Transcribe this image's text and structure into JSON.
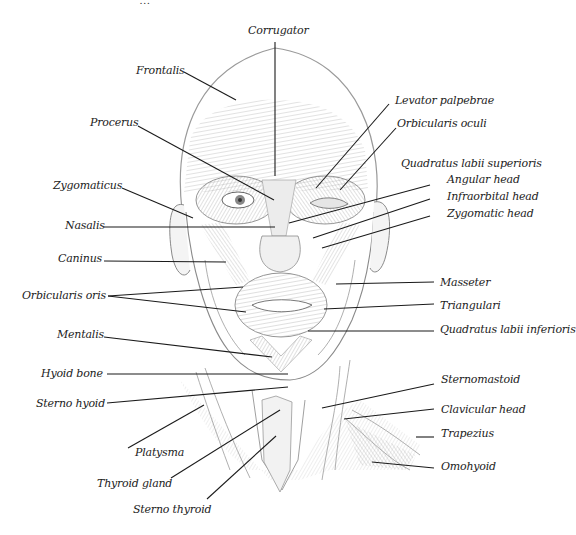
{
  "figure": {
    "title_partial": "…",
    "line_color": "#1a1a1a",
    "sketch_color": "#8a8a8a",
    "text_color": "#222222"
  },
  "labels": [
    {
      "id": "corrugator",
      "text": "Corrugator",
      "x": 248,
      "y": 24,
      "align": "left",
      "line": [
        [
          275,
          42
        ],
        [
          275,
          176
        ]
      ]
    },
    {
      "id": "frontalis",
      "text": "Frontalis",
      "x": 136,
      "y": 64,
      "align": "left",
      "line": [
        [
          184,
          72
        ],
        [
          236,
          100
        ]
      ]
    },
    {
      "id": "procerus",
      "text": "Procerus",
      "x": 90,
      "y": 116,
      "align": "left",
      "line": [
        [
          138,
          126
        ],
        [
          274,
          200
        ]
      ]
    },
    {
      "id": "levator-palpebrae",
      "text": "Levator palpebrae",
      "x": 395,
      "y": 94,
      "align": "left",
      "line": [
        [
          389,
          104
        ],
        [
          316,
          188
        ]
      ]
    },
    {
      "id": "orbicularis-oculi",
      "text": "Orbicularis oculi",
      "x": 397,
      "y": 117,
      "align": "left",
      "line": [
        [
          396,
          128
        ],
        [
          340,
          190
        ]
      ]
    },
    {
      "id": "quadratus-labii-superioris",
      "text": "Quadratus labii superioris",
      "x": 401,
      "y": 157,
      "align": "left",
      "line": null
    },
    {
      "id": "angular-head",
      "text": "Angular head",
      "x": 447,
      "y": 173,
      "align": "left",
      "line": [
        [
          430,
          185
        ],
        [
          289,
          223
        ]
      ]
    },
    {
      "id": "infraorbital-head",
      "text": "Infraorbital head",
      "x": 447,
      "y": 190,
      "align": "left",
      "line": [
        [
          430,
          199
        ],
        [
          313,
          238
        ]
      ]
    },
    {
      "id": "zygomatic-head",
      "text": "Zygomatic head",
      "x": 447,
      "y": 207,
      "align": "left",
      "line": [
        [
          430,
          216
        ],
        [
          322,
          248
        ]
      ]
    },
    {
      "id": "zygomaticus",
      "text": "Zygomaticus",
      "x": 53,
      "y": 179,
      "align": "left",
      "line": [
        [
          122,
          188
        ],
        [
          193,
          218
        ]
      ]
    },
    {
      "id": "nasalis",
      "text": "Nasalis",
      "x": 65,
      "y": 219,
      "align": "left",
      "line": [
        [
          104,
          227
        ],
        [
          275,
          227
        ]
      ]
    },
    {
      "id": "caninus",
      "text": "Caninus",
      "x": 58,
      "y": 252,
      "align": "left",
      "line": [
        [
          104,
          261
        ],
        [
          226,
          262
        ]
      ]
    },
    {
      "id": "orbicularis-oris",
      "text": "Orbicularis oris",
      "x": 22,
      "y": 289,
      "align": "left",
      "line": [
        [
          108,
          296
        ],
        [
          243,
          287
        ]
      ],
      "line2": [
        [
          108,
          296
        ],
        [
          246,
          312
        ]
      ]
    },
    {
      "id": "mentalis",
      "text": "Mentalis",
      "x": 57,
      "y": 328,
      "align": "left",
      "line": [
        [
          104,
          337
        ],
        [
          272,
          357
        ]
      ]
    },
    {
      "id": "masseter",
      "text": "Masseter",
      "x": 440,
      "y": 276,
      "align": "left",
      "line": [
        [
          434,
          282
        ],
        [
          336,
          284
        ]
      ]
    },
    {
      "id": "triangulari",
      "text": "Triangulari",
      "x": 440,
      "y": 299,
      "align": "left",
      "line": [
        [
          434,
          304
        ],
        [
          324,
          309
        ]
      ]
    },
    {
      "id": "quadratus-labii-inferioris",
      "text": "Quadratus labii inferioris",
      "x": 440,
      "y": 323,
      "align": "left",
      "line": [
        [
          434,
          331
        ],
        [
          308,
          331
        ]
      ]
    },
    {
      "id": "hyoid-bone",
      "text": "Hyoid bone",
      "x": 41,
      "y": 367,
      "align": "left",
      "line": [
        [
          107,
          374
        ],
        [
          288,
          374
        ]
      ]
    },
    {
      "id": "sterno-hyoid",
      "text": "Sterno hyoid",
      "x": 36,
      "y": 397,
      "align": "left",
      "line": [
        [
          107,
          403
        ],
        [
          288,
          387
        ]
      ]
    },
    {
      "id": "platysma",
      "text": "Platysma",
      "x": 135,
      "y": 446,
      "align": "left",
      "line": [
        [
          128,
          448
        ],
        [
          204,
          405
        ]
      ]
    },
    {
      "id": "thyroid-gland",
      "text": "Thyroid gland",
      "x": 97,
      "y": 477,
      "align": "left",
      "line": [
        [
          171,
          478
        ],
        [
          280,
          410
        ]
      ]
    },
    {
      "id": "sterno-thyroid",
      "text": "Sterno thyroid",
      "x": 133,
      "y": 503,
      "align": "left",
      "line": [
        [
          207,
          499
        ],
        [
          276,
          436
        ]
      ]
    },
    {
      "id": "sternomastoid",
      "text": "Sternomastoid",
      "x": 441,
      "y": 373,
      "align": "left",
      "line": [
        [
          434,
          384
        ],
        [
          322,
          408
        ]
      ]
    },
    {
      "id": "clavicular-head",
      "text": "Clavicular head",
      "x": 441,
      "y": 403,
      "align": "left",
      "line": [
        [
          434,
          409
        ],
        [
          344,
          419
        ]
      ]
    },
    {
      "id": "trapezius",
      "text": "Trapezius",
      "x": 441,
      "y": 427,
      "align": "left",
      "line": [
        [
          434,
          437
        ],
        [
          416,
          437
        ]
      ]
    },
    {
      "id": "omohyoid",
      "text": "Omohyoid",
      "x": 441,
      "y": 460,
      "align": "left",
      "line": [
        [
          434,
          468
        ],
        [
          372,
          462
        ]
      ]
    }
  ]
}
